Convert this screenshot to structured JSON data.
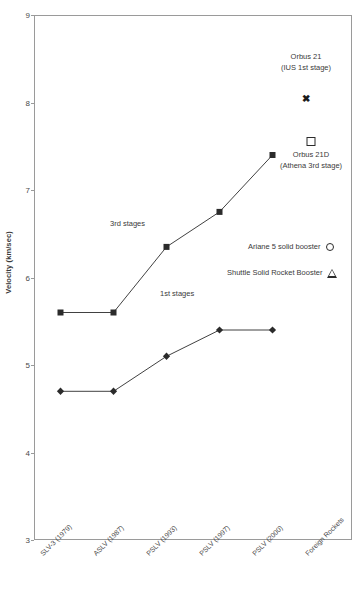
{
  "chart_data": {
    "type": "line",
    "title": "",
    "xlabel": "",
    "ylabel": "Velocity (km/sec)",
    "ylim": [
      3,
      9
    ],
    "yticks": [
      3,
      4,
      5,
      6,
      7,
      8,
      9
    ],
    "grid": false,
    "legend_position": "inside-right",
    "categories": [
      "SLV-3 (1979)",
      "ASLV (1987)",
      "PSLV (1993)",
      "PSLV (1997)",
      "PSLV (2000)",
      "Foreign Rockets"
    ],
    "series": [
      {
        "name": "3rd stages",
        "marker": "filled-square",
        "values": [
          5.6,
          5.6,
          6.35,
          6.75,
          7.4,
          null
        ]
      },
      {
        "name": "1st stages",
        "marker": "filled-diamond",
        "values": [
          4.7,
          4.7,
          5.1,
          5.4,
          5.4,
          null
        ]
      }
    ],
    "annotations": [
      {
        "name": "orbus-21",
        "label_line1": "Orbus 21",
        "label_line2": "(IUS 1st stage)",
        "marker": "x",
        "x_category": "Foreign Rockets",
        "value": 8.05
      },
      {
        "name": "orbus-21d",
        "label_line1": "Orbus 21D",
        "label_line2": "(Athena 3rd stage)",
        "marker": "open-square",
        "x_category": "Foreign Rockets",
        "value": 7.18
      },
      {
        "name": "ariane-5-solid-booster",
        "label_line1": "Ariane 5 solid booster",
        "label_line2": "",
        "marker": "open-circle",
        "x_category": "Foreign Rockets",
        "value": 6.02
      },
      {
        "name": "shuttle-solid-rocket-booster",
        "label_line1": "Shuttle Solid Rocket Booster",
        "label_line2": "",
        "marker": "open-triangle",
        "x_category": "Foreign Rockets",
        "value": 5.75
      }
    ]
  },
  "axis": {
    "y_title": "Velocity (km/sec)",
    "y_tick_labels": [
      "9",
      "8",
      "7",
      "6",
      "5",
      "4",
      "3"
    ],
    "x_tick_labels": [
      "SLV-3 (1979)",
      "ASLV (1987)",
      "PSLV (1993)",
      "PSLV (1997)",
      "PSLV (2000)",
      "Foreign Rockets"
    ]
  },
  "series_labels": {
    "third_stages": "3rd stages",
    "first_stages": "1st stages"
  },
  "legend": {
    "orbus21_line1": "Orbus 21",
    "orbus21_line2": "(IUS 1st stage)",
    "orbus21d_line1": "Orbus 21D",
    "orbus21d_line2": "(Athena 3rd stage)",
    "ariane5": "Ariane 5 solid booster",
    "shuttle_srb": "Shuttle Solid Rocket Booster"
  },
  "colors": {
    "line": "#2b2b2b",
    "frame": "#9a9a9a",
    "text": "#3a3a3a",
    "background": "#ffffff"
  }
}
